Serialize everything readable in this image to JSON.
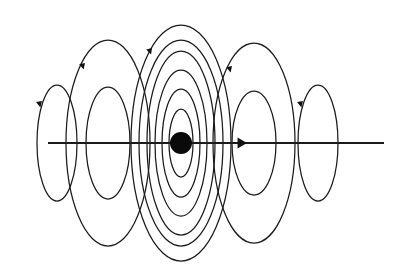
{
  "figure": {
    "title": "",
    "subtitle": "",
    "caption": "",
    "background_color": "#ffffff",
    "line_color": "#1b1b1b",
    "dot_color": "#0a0a0a",
    "width": 402,
    "height": 279,
    "kind": "field-line-diagram",
    "description_labels": []
  },
  "axis": {
    "name": "current-axis",
    "label": "",
    "x_start": 48,
    "x_end": 384,
    "y": 143,
    "stroke_width": 1.9,
    "arrow": {
      "name": "axis-arrow",
      "x": 240,
      "y": 143,
      "direction": "right",
      "size": 7
    }
  },
  "source": {
    "name": "central-source-dot",
    "label": "",
    "cx": 181,
    "cy": 143,
    "rx": 11,
    "ry": 11
  },
  "loop_groups": [
    {
      "name": "loop-group-far-left",
      "cx": 57,
      "cy": 143,
      "count": 1,
      "ellipses": [
        {
          "rx": 20,
          "ry": 58
        }
      ],
      "arrow": {
        "x": 42,
        "y": 101,
        "angle": -46,
        "size": 6
      }
    },
    {
      "name": "loop-group-left",
      "cx": 108,
      "cy": 143,
      "count": 2,
      "ellipses": [
        {
          "rx": 22,
          "ry": 56
        },
        {
          "rx": 42,
          "ry": 103
        }
      ],
      "arrow": {
        "x": 85,
        "y": 63,
        "angle": -48,
        "size": 6
      }
    },
    {
      "name": "loop-group-center",
      "cx": 181,
      "cy": 143,
      "count": 6,
      "ellipses": [
        {
          "rx": 12,
          "ry": 34
        },
        {
          "rx": 19,
          "ry": 54
        },
        {
          "rx": 26,
          "ry": 73
        },
        {
          "rx": 34,
          "ry": 92
        },
        {
          "rx": 42,
          "ry": 103
        },
        {
          "rx": 50,
          "ry": 118
        }
      ],
      "arrow": {
        "x": 152,
        "y": 48,
        "angle": -52,
        "size": 6
      }
    },
    {
      "name": "loop-group-right",
      "cx": 254,
      "cy": 143,
      "count": 2,
      "ellipses": [
        {
          "rx": 22,
          "ry": 52
        },
        {
          "rx": 41,
          "ry": 100
        }
      ],
      "arrow": {
        "x": 232,
        "y": 66,
        "angle": -48,
        "size": 6
      }
    },
    {
      "name": "loop-group-far-right",
      "cx": 318,
      "cy": 143,
      "count": 1,
      "ellipses": [
        {
          "rx": 20,
          "ry": 58
        }
      ],
      "arrow": {
        "x": 303,
        "y": 101,
        "angle": -46,
        "size": 6
      }
    }
  ],
  "chart_data": {
    "type": "scatter",
    "title": "",
    "xlabel": "",
    "ylabel": "",
    "grid": false,
    "legend": "none",
    "annotations": [],
    "categories": [
      "far-left",
      "left",
      "center",
      "right",
      "far-right"
    ],
    "values": [
      1,
      2,
      6,
      2,
      1
    ],
    "series": [
      {
        "name": "loops-per-group",
        "values": [
          1,
          2,
          6,
          2,
          1
        ]
      },
      {
        "name": "group-center-x",
        "values": [
          57,
          108,
          181,
          254,
          318
        ]
      },
      {
        "name": "outer-ellipse-ry",
        "values": [
          58,
          103,
          118,
          100,
          58
        ]
      },
      {
        "name": "outer-ellipse-rx",
        "values": [
          20,
          42,
          50,
          41,
          20
        ]
      }
    ],
    "xlim": [
      0,
      402
    ],
    "ylim": [
      0,
      279
    ]
  }
}
